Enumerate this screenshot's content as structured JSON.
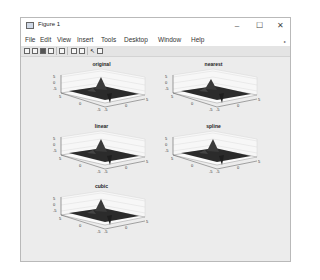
{
  "window": {
    "title": "Figure 1",
    "controls": {
      "minimize": "–",
      "maximize": "☐",
      "close": "✕"
    }
  },
  "menu": {
    "items": [
      "File",
      "Edit",
      "View",
      "Insert",
      "Tools",
      "Desktop",
      "Window",
      "Help"
    ],
    "overflow_arrow": "▸"
  },
  "toolbar": {
    "tools": [
      "new-figure-icon",
      "open-file-icon",
      "save-icon",
      "print-icon",
      "zoom-icon",
      "colorbar-icon",
      "legend-icon",
      "pointer-icon",
      "property-editor-icon"
    ]
  },
  "subplots": [
    {
      "title": "original",
      "surface": "peaks"
    },
    {
      "title": "nearest",
      "surface": "peaks-nearest"
    },
    {
      "title": "linear",
      "surface": "peaks-linear"
    },
    {
      "title": "spline",
      "surface": "peaks-spline"
    },
    {
      "title": "cubic",
      "surface": "peaks-cubic"
    }
  ],
  "axes": {
    "x_ticks": [
      "-5",
      "0",
      "5"
    ],
    "y_ticks": [
      "-5",
      "0",
      "5"
    ],
    "z_ticks": [
      "5",
      "0",
      "-5"
    ]
  },
  "colors": {
    "surface": "#2b2b2b",
    "canvas": "#ececec",
    "grid": "#d6d6d6"
  }
}
